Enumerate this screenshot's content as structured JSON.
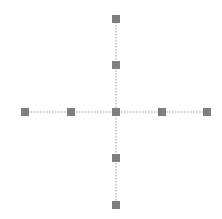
{
  "diagram": {
    "type": "cross-graph",
    "node_color": "#7f7f7f",
    "edge_color": "#9a9a9a",
    "node_size": 8,
    "nodes": [
      {
        "id": "top-far",
        "x": 116,
        "y": 19
      },
      {
        "id": "top-near",
        "x": 116,
        "y": 65
      },
      {
        "id": "left-far",
        "x": 25,
        "y": 112
      },
      {
        "id": "left-near",
        "x": 71,
        "y": 112
      },
      {
        "id": "center",
        "x": 116,
        "y": 112
      },
      {
        "id": "right-near",
        "x": 162,
        "y": 112
      },
      {
        "id": "right-far",
        "x": 207,
        "y": 112
      },
      {
        "id": "bottom-near",
        "x": 116,
        "y": 158
      },
      {
        "id": "bottom-far",
        "x": 116,
        "y": 205
      }
    ],
    "edges": [
      {
        "from": "top-far",
        "to": "bottom-far"
      },
      {
        "from": "left-far",
        "to": "right-far"
      }
    ]
  }
}
